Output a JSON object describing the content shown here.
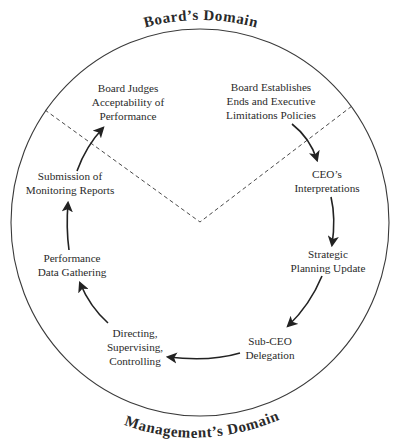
{
  "diagram": {
    "type": "cycle",
    "domains": {
      "top": "Board’s Domain",
      "bottom": "Management’s Domain"
    },
    "nodes": [
      {
        "id": "board-establishes",
        "lines": [
          "Board Establishes",
          "Ends and Executive",
          "Limitations Policies"
        ],
        "domain": "board"
      },
      {
        "id": "ceo-interpretations",
        "lines": [
          "CEO’s",
          "Interpretations"
        ],
        "domain": "management"
      },
      {
        "id": "strategic-planning",
        "lines": [
          "Strategic",
          "Planning Update"
        ],
        "domain": "management"
      },
      {
        "id": "sub-ceo-delegation",
        "lines": [
          "Sub-CEO",
          "Delegation"
        ],
        "domain": "management"
      },
      {
        "id": "directing",
        "lines": [
          "Directing,",
          "Supervising,",
          "Controlling"
        ],
        "domain": "management"
      },
      {
        "id": "performance-data",
        "lines": [
          "Performance",
          "Data Gathering"
        ],
        "domain": "management"
      },
      {
        "id": "submission-reports",
        "lines": [
          "Submission of",
          "Monitoring Reports"
        ],
        "domain": "management"
      },
      {
        "id": "board-judges",
        "lines": [
          "Board Judges",
          "Acceptability of",
          "Performance"
        ],
        "domain": "board"
      }
    ],
    "flow": [
      "Board Establishes Ends and Executive Limitations Policies",
      "CEO’s Interpretations",
      "Strategic Planning Update",
      "Sub-CEO Delegation",
      "Directing, Supervising, Controlling",
      "Performance Data Gathering",
      "Submission of Monitoring Reports",
      "Board Judges Acceptability of Performance"
    ]
  }
}
